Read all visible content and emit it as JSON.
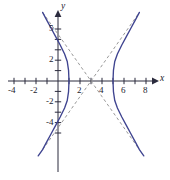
{
  "figure": {
    "kind": "hyperbola-graph",
    "background_color": "#ffffff",
    "curve_color": "#3f4490",
    "asymptote_color": "#8c8c8c",
    "axis_color": "#2b2b3d",
    "label_color": "#1a1a2e"
  },
  "axes": {
    "x_label": "x",
    "y_label": "y",
    "x_ticks": [
      {
        "value": -4,
        "label": "-4"
      },
      {
        "value": -3,
        "label": ""
      },
      {
        "value": -2,
        "label": "-2"
      },
      {
        "value": -1,
        "label": ""
      },
      {
        "value": 1,
        "label": ""
      },
      {
        "value": 2,
        "label": "2"
      },
      {
        "value": 3,
        "label": ""
      },
      {
        "value": 4,
        "label": "4"
      },
      {
        "value": 5,
        "label": ""
      },
      {
        "value": 6,
        "label": "6"
      },
      {
        "value": 7,
        "label": ""
      },
      {
        "value": 8,
        "label": "8"
      }
    ],
    "y_ticks": [
      {
        "value": 5,
        "label": "5"
      },
      {
        "value": 4,
        "label": ""
      },
      {
        "value": 3,
        "label": ""
      },
      {
        "value": 2,
        "label": "2"
      },
      {
        "value": 1,
        "label": ""
      },
      {
        "value": -1,
        "label": ""
      },
      {
        "value": -2,
        "label": "-2"
      },
      {
        "value": -3,
        "label": ""
      },
      {
        "value": -4,
        "label": "-4"
      },
      {
        "value": -5,
        "label": ""
      }
    ],
    "x_range": [
      -5.4,
      9.2
    ],
    "y_range": [
      -7.2,
      6.6
    ]
  },
  "chart_data": {
    "type": "line",
    "title": "",
    "xlabel": "x",
    "ylabel": "y",
    "xlim": [
      -5.4,
      9.2
    ],
    "ylim": [
      -7.2,
      6.6
    ],
    "grid": false,
    "legend": "none",
    "curve_kind": "hyperbola",
    "center": [
      3,
      0
    ],
    "vertices": [
      [
        1,
        0
      ],
      [
        5,
        0
      ]
    ],
    "a": 2,
    "b": 3,
    "orientation": "horizontal",
    "equation": "(x-3)^2/4 - y^2/9 = 1",
    "series": [
      {
        "name": "left-branch",
        "style": "solid",
        "color": "#3f4490",
        "points": [
          [
            -1.4,
            6.6
          ],
          [
            -1.0,
            5.81
          ],
          [
            -0.6,
            5.02
          ],
          [
            -0.2,
            4.24
          ],
          [
            0.2,
            3.46
          ],
          [
            0.6,
            2.6
          ],
          [
            0.84,
            1.88
          ],
          [
            0.96,
            1.02
          ],
          [
            1.0,
            0.0
          ],
          [
            0.96,
            -1.02
          ],
          [
            0.84,
            -1.88
          ],
          [
            0.6,
            -2.6
          ],
          [
            0.2,
            -3.46
          ],
          [
            -0.2,
            -4.24
          ],
          [
            -0.6,
            -5.02
          ],
          [
            -1.0,
            -5.81
          ],
          [
            -1.4,
            -6.6
          ],
          [
            -1.8,
            -7.2
          ]
        ]
      },
      {
        "name": "right-branch",
        "style": "solid",
        "color": "#3f4490",
        "points": [
          [
            7.4,
            6.6
          ],
          [
            7.0,
            5.81
          ],
          [
            6.6,
            5.02
          ],
          [
            6.2,
            4.24
          ],
          [
            5.8,
            3.46
          ],
          [
            5.4,
            2.6
          ],
          [
            5.16,
            1.88
          ],
          [
            5.04,
            1.02
          ],
          [
            5.0,
            0.0
          ],
          [
            5.04,
            -1.02
          ],
          [
            5.16,
            -1.88
          ],
          [
            5.4,
            -2.6
          ],
          [
            5.8,
            -3.46
          ],
          [
            6.2,
            -4.24
          ],
          [
            6.6,
            -5.02
          ],
          [
            7.0,
            -5.81
          ],
          [
            7.4,
            -6.6
          ],
          [
            7.8,
            -7.2
          ]
        ]
      },
      {
        "name": "asymptote-positive-slope",
        "style": "dashed",
        "color": "#8c8c8c",
        "slope": 1.5,
        "intercept": -4.5,
        "points": [
          [
            -1.4,
            -6.6
          ],
          [
            7.4,
            6.6
          ]
        ]
      },
      {
        "name": "asymptote-negative-slope",
        "style": "dashed",
        "color": "#8c8c8c",
        "slope": -1.5,
        "intercept": 4.5,
        "points": [
          [
            -1.4,
            6.6
          ],
          [
            7.4,
            -6.6
          ]
        ]
      }
    ]
  }
}
